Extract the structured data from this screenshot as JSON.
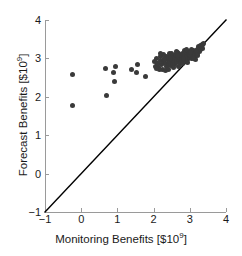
{
  "chart_data": {
    "type": "scatter",
    "title": "",
    "xlabel": "Monitoring Benefits [$10⁹]",
    "ylabel": "Forecast Benefits [$10⁹]",
    "xlabel_prefix": "Monitoring Benefits [$10",
    "xlabel_exponent": "9",
    "xlabel_suffix": "]",
    "ylabel_prefix": "Forecast Benefits [$10",
    "ylabel_exponent": "9",
    "ylabel_suffix": "]",
    "xlim": [
      -1,
      4
    ],
    "ylim": [
      -1,
      4
    ],
    "xticks": [
      -1,
      0,
      1,
      2,
      3,
      4
    ],
    "yticks": [
      -1,
      0,
      1,
      2,
      3,
      4
    ],
    "xticklabels": [
      "−1",
      "0",
      "1",
      "2",
      "3",
      "4"
    ],
    "yticklabels": [
      "−1",
      "0",
      "1",
      "2",
      "3",
      "4"
    ],
    "grid": false,
    "legend": null,
    "marker_color": "#3a3a3a",
    "marker_size_px": 5,
    "reference_line": {
      "name": "one-to-one-line",
      "type": "identity",
      "slope": 1,
      "intercept": 0,
      "from": [
        -1,
        -1
      ],
      "to": [
        4,
        4
      ],
      "color": "#000000",
      "width_px": 1.4
    },
    "points": [
      [
        -0.25,
        2.58
      ],
      [
        -0.25,
        1.78
      ],
      [
        0.68,
        2.74
      ],
      [
        0.7,
        2.03
      ],
      [
        0.88,
        2.62
      ],
      [
        0.95,
        2.8
      ],
      [
        0.92,
        2.41
      ],
      [
        1.4,
        2.72
      ],
      [
        1.55,
        2.84
      ],
      [
        1.52,
        2.62
      ],
      [
        1.78,
        2.52
      ],
      [
        2.03,
        2.92
      ],
      [
        2.05,
        2.8
      ],
      [
        2.08,
        3.0
      ],
      [
        2.12,
        2.86
      ],
      [
        2.14,
        2.76
      ],
      [
        2.18,
        2.95
      ],
      [
        2.2,
        3.04
      ],
      [
        2.22,
        2.84
      ],
      [
        2.25,
        2.72
      ],
      [
        2.28,
        2.93
      ],
      [
        2.3,
        3.01
      ],
      [
        2.32,
        2.88
      ],
      [
        2.35,
        2.78
      ],
      [
        2.36,
        3.06
      ],
      [
        2.38,
        2.96
      ],
      [
        2.4,
        2.86
      ],
      [
        2.42,
        3.02
      ],
      [
        2.44,
        2.92
      ],
      [
        2.46,
        2.82
      ],
      [
        2.48,
        3.08
      ],
      [
        2.5,
        2.98
      ],
      [
        2.52,
        2.88
      ],
      [
        2.54,
        3.04
      ],
      [
        2.56,
        2.94
      ],
      [
        2.58,
        2.84
      ],
      [
        2.6,
        3.1
      ],
      [
        2.62,
        3.0
      ],
      [
        2.64,
        2.9
      ],
      [
        2.66,
        3.06
      ],
      [
        2.68,
        2.96
      ],
      [
        2.7,
        3.12
      ],
      [
        2.72,
        3.02
      ],
      [
        2.74,
        2.92
      ],
      [
        2.76,
        3.08
      ],
      [
        2.78,
        2.98
      ],
      [
        2.8,
        3.14
      ],
      [
        2.82,
        3.04
      ],
      [
        2.84,
        2.94
      ],
      [
        2.86,
        3.1
      ],
      [
        2.88,
        3.0
      ],
      [
        2.9,
        3.16
      ],
      [
        2.92,
        3.06
      ],
      [
        2.94,
        2.98
      ],
      [
        2.96,
        3.12
      ],
      [
        2.98,
        3.02
      ],
      [
        3.0,
        3.18
      ],
      [
        3.02,
        3.08
      ],
      [
        3.04,
        3.0
      ],
      [
        3.06,
        3.14
      ],
      [
        3.08,
        3.05
      ],
      [
        3.1,
        3.2
      ],
      [
        3.12,
        3.11
      ],
      [
        3.14,
        3.03
      ],
      [
        3.16,
        3.17
      ],
      [
        3.18,
        3.09
      ],
      [
        3.2,
        3.22
      ],
      [
        3.22,
        3.14
      ],
      [
        3.24,
        3.26
      ],
      [
        3.26,
        3.18
      ],
      [
        3.28,
        3.29
      ],
      [
        3.3,
        3.22
      ],
      [
        3.32,
        3.33
      ],
      [
        3.34,
        3.26
      ],
      [
        3.36,
        3.37
      ],
      [
        3.38,
        3.4
      ],
      [
        2.1,
        2.88
      ],
      [
        2.26,
        3.1
      ],
      [
        2.44,
        3.12
      ],
      [
        2.55,
        2.76
      ],
      [
        2.66,
        3.16
      ],
      [
        2.75,
        2.86
      ],
      [
        2.85,
        3.2
      ],
      [
        2.95,
        2.9
      ],
      [
        3.05,
        3.24
      ],
      [
        3.15,
        2.97
      ],
      [
        2.15,
        2.7
      ],
      [
        2.33,
        2.68
      ],
      [
        2.5,
        3.14
      ],
      [
        2.7,
        2.8
      ],
      [
        2.9,
        3.22
      ],
      [
        3.1,
        2.99
      ],
      [
        3.25,
        3.3
      ],
      [
        2.2,
        3.12
      ],
      [
        2.4,
        2.7
      ],
      [
        2.62,
        3.18
      ],
      [
        2.8,
        2.88
      ],
      [
        3.0,
        3.1
      ],
      [
        3.18,
        3.2
      ],
      [
        3.3,
        3.34
      ],
      [
        2.07,
        2.74
      ],
      [
        2.29,
        2.98
      ],
      [
        2.47,
        3.0
      ],
      [
        2.65,
        3.08
      ],
      [
        2.83,
        2.99
      ],
      [
        3.01,
        3.16
      ],
      [
        3.2,
        3.08
      ],
      [
        3.35,
        3.35
      ]
    ]
  }
}
